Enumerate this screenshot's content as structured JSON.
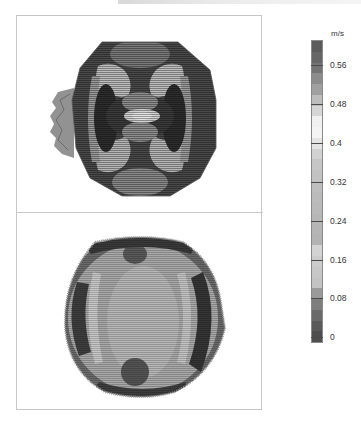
{
  "chart_data": {
    "type": "heatmap",
    "title": "",
    "panels": [
      {
        "name": "top-panel",
        "pattern": "octagonal section; four dark lobes with curved light bands, light elliptical core at center, jagged vector fringe on left edge",
        "high_velocity_regions": "outer ring and four lobes (dark, ~0.56-0.64 m/s)",
        "low_velocity_regions": "center ellipse (light, ~0.44-0.48 m/s)"
      },
      {
        "name": "bottom-panel",
        "pattern": "near-circular section; mostly medium gray, dark crescents on left and right edges, two darker spots near top-center and bottom-center",
        "high_velocity_regions": "left and right crescents (dark)",
        "low_velocity_regions": "broad central region (~0.24-0.32 m/s gray)"
      }
    ],
    "colorbar": {
      "unit": "m/s",
      "min": 0,
      "max": 0.64,
      "ticks": [
        0.56,
        0.48,
        0.4,
        0.32,
        0.24,
        0.16,
        0.08,
        0
      ],
      "tick_labels": [
        "0.56",
        "0.48",
        "0.4",
        "0.32",
        "0.24",
        "0.16",
        "0.08",
        "0"
      ],
      "orientation": "vertical",
      "position": "right"
    },
    "grid": false,
    "legend_position": "right"
  },
  "colorbar": {
    "unit": "m/s",
    "ticks": [
      {
        "label": "0.56",
        "y": 65
      },
      {
        "label": "0.48",
        "y": 104
      },
      {
        "label": "0.4",
        "y": 143
      },
      {
        "label": "0.32",
        "y": 182
      },
      {
        "label": "0.24",
        "y": 221
      },
      {
        "label": "0.16",
        "y": 260
      },
      {
        "label": "0.08",
        "y": 298
      },
      {
        "label": "0",
        "y": 337
      }
    ],
    "bands": [
      "#5c5c5c",
      "#666666",
      "#747474",
      "#8c8c8c",
      "#a0a0a0",
      "#bdbdbd",
      "#d6d6d6",
      "#f0f0f0",
      "#f4f4f4",
      "#e4e4e4",
      "#d2d2d2",
      "#c6c6c6",
      "#c2c2c2",
      "#bebebe",
      "#bbbbbb",
      "#b9b9b9",
      "#b7b7b7",
      "#b5b5b5",
      "#b3b3b3",
      "#d3d3d3",
      "#cbcbcb",
      "#c7c7c7",
      "#c3c3c3",
      "#9a9a9a",
      "#7e7e7e",
      "#6a6a6a",
      "#5a5a5a",
      "#4e4e4e"
    ]
  }
}
